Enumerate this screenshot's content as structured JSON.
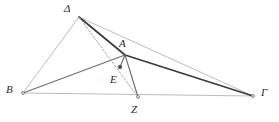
{
  "figure": {
    "background_color": "#ffffff",
    "width": 279,
    "height": 122
  },
  "style": {
    "line_color_light": "#a9a9a9",
    "line_color_mid": "#6e6e6e",
    "line_color_dark": "#3a3a3a",
    "dash_color": "#b0a9a0",
    "label_color": "#2b2b2b",
    "point_marker_color": "#4a4a4a"
  },
  "points": [
    {
      "id": "delta",
      "label": "Δ",
      "x": 79,
      "y": 17,
      "label_x": 64,
      "label_y": 3,
      "marker": false
    },
    {
      "id": "alpha",
      "label": "Α",
      "x": 125,
      "y": 55,
      "label_x": 119,
      "label_y": 38,
      "marker": false
    },
    {
      "id": "beta",
      "label": "B",
      "x": 23,
      "y": 93,
      "label_x": 6,
      "label_y": 84,
      "marker": true
    },
    {
      "id": "gamma",
      "label": "Γ",
      "x": 253,
      "y": 96,
      "label_x": 261,
      "label_y": 87,
      "marker": true
    },
    {
      "id": "epsilon",
      "label": "E",
      "x": 120,
      "y": 67,
      "label_x": 110,
      "label_y": 74,
      "marker": true
    },
    {
      "id": "zeta",
      "label": "Z",
      "x": 138,
      "y": 97,
      "label_x": 131,
      "label_y": 104,
      "marker": true
    }
  ],
  "segments": [
    {
      "id": "delta-beta",
      "from": "delta",
      "to": "beta",
      "weight": "light",
      "dashed": false
    },
    {
      "id": "delta-gamma",
      "from": "delta",
      "to": "gamma",
      "weight": "light",
      "dashed": false
    },
    {
      "id": "beta-gamma",
      "from": "beta",
      "to": "gamma",
      "weight": "light",
      "dashed": false
    },
    {
      "id": "delta-alpha",
      "from": "delta",
      "to": "alpha",
      "weight": "dark",
      "dashed": false
    },
    {
      "id": "alpha-gamma",
      "from": "alpha",
      "to": "gamma",
      "weight": "dark",
      "dashed": false
    },
    {
      "id": "beta-alpha",
      "from": "beta",
      "to": "alpha",
      "weight": "mid",
      "dashed": false
    },
    {
      "id": "alpha-zeta",
      "from": "alpha",
      "to": "zeta",
      "weight": "mid",
      "dashed": false
    },
    {
      "id": "delta-zeta",
      "from": "delta",
      "to": "zeta",
      "weight": "dash",
      "dashed": true
    },
    {
      "id": "alpha-epsilon",
      "from": "alpha",
      "to": "epsilon",
      "weight": "mid",
      "dashed": false
    }
  ]
}
